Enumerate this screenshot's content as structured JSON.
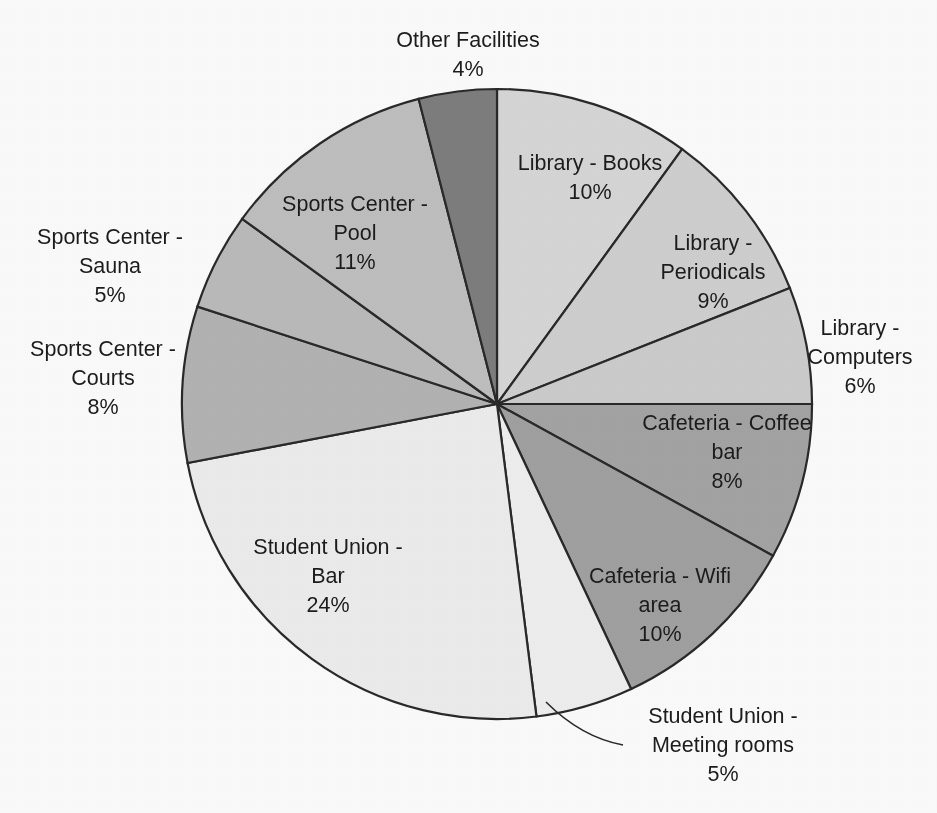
{
  "title_visible_fragment": "",
  "chart_data": {
    "type": "pie",
    "title": "",
    "xlabel": "",
    "ylabel": "",
    "legend": "none",
    "labels_position": "inside-and-outside-with-leader-lines",
    "start_angle_deg": 0,
    "direction": "clockwise",
    "value_unit": "%",
    "categories": [
      "Library - Books",
      "Library - Periodicals",
      "Library - Computers",
      "Cafeteria - Coffee bar",
      "Cafeteria - Wifi area",
      "Student Union - Meeting rooms",
      "Student Union - Bar",
      "Sports Center - Courts",
      "Sports Center - Sauna",
      "Sports Center - Pool",
      "Other Facilities"
    ],
    "values": [
      10,
      9,
      6,
      8,
      10,
      5,
      24,
      8,
      5,
      11,
      4
    ],
    "value_labels": [
      "10%",
      "9%",
      "6%",
      "8%",
      "10%",
      "5%",
      "24%",
      "8%",
      "5%",
      "11%",
      "4%"
    ],
    "colors": [
      "#d9d9d9",
      "#d2d2d2",
      "#cfcfcf",
      "#a6a6a6",
      "#a3a3a3",
      "#f2f2f2",
      "#f0f0f0",
      "#b5b5b5",
      "#bdbdbd",
      "#c2c2c2",
      "#7f7f7f"
    ],
    "total": 100
  },
  "slices": [
    {
      "name": "Library - Books",
      "label_line1": "Library - Books",
      "label_line2": "10%",
      "percent": 10,
      "color": "#d9d9d9"
    },
    {
      "name": "Library - Periodicals",
      "label_line1": "Library -\nPeriodicals",
      "label_line2": "9%",
      "percent": 9,
      "color": "#d2d2d2"
    },
    {
      "name": "Library - Computers",
      "label_line1": "Library -\nComputers",
      "label_line2": "6%",
      "percent": 6,
      "color": "#cfcfcf"
    },
    {
      "name": "Cafeteria - Coffee bar",
      "label_line1": "Cafeteria - Coffee\nbar",
      "label_line2": "8%",
      "percent": 8,
      "color": "#a6a6a6"
    },
    {
      "name": "Cafeteria - Wifi area",
      "label_line1": "Cafeteria - Wifi\narea",
      "label_line2": "10%",
      "percent": 10,
      "color": "#a3a3a3"
    },
    {
      "name": "Student Union - Meeting rooms",
      "label_line1": "Student Union -\nMeeting rooms",
      "label_line2": "5%",
      "percent": 5,
      "color": "#f2f2f2"
    },
    {
      "name": "Student Union - Bar",
      "label_line1": "Student Union -\nBar",
      "label_line2": "24%",
      "percent": 24,
      "color": "#f0f0f0"
    },
    {
      "name": "Sports Center - Courts",
      "label_line1": "Sports Center -\nCourts",
      "label_line2": "8%",
      "percent": 8,
      "color": "#b5b5b5"
    },
    {
      "name": "Sports Center - Sauna",
      "label_line1": "Sports Center -\nSauna",
      "label_line2": "5%",
      "percent": 5,
      "color": "#bdbdbd"
    },
    {
      "name": "Sports Center - Pool",
      "label_line1": "Sports Center -\nPool",
      "label_line2": "11%",
      "percent": 11,
      "color": "#c2c2c2"
    },
    {
      "name": "Other Facilities",
      "label_line1": "Other Facilities",
      "label_line2": "4%",
      "percent": 4,
      "color": "#7f7f7f"
    }
  ]
}
